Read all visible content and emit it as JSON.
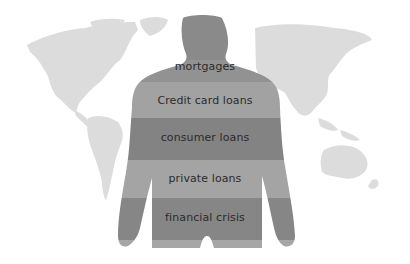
{
  "illustration": {
    "description": "Human torso silhouette over a world map, banded with debt categories",
    "bands": [
      {
        "label": "mortgages",
        "color": "#8e8e8e"
      },
      {
        "label": "Credit card loans",
        "color": "#a3a3a3"
      },
      {
        "label": "consumer loans",
        "color": "#858585"
      },
      {
        "label": "private loans",
        "color": "#a5a5a5"
      },
      {
        "label": "financial crisis",
        "color": "#868686"
      }
    ],
    "colors": {
      "background": "#ffffff",
      "map": "#dcdcdc",
      "text": "#2b2b2b"
    }
  }
}
